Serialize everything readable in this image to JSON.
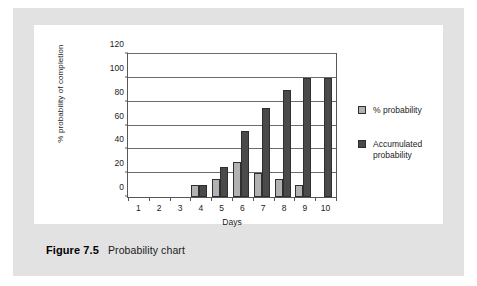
{
  "figure": {
    "caption_number": "Figure 7.5",
    "caption_text": "Probability chart"
  },
  "legend": {
    "position": "right",
    "items": [
      {
        "label": "% probability",
        "color": "#b2b2b2"
      },
      {
        "label": "Accumulated probability",
        "color": "#4a4a4a"
      }
    ]
  },
  "chart_data": {
    "type": "bar",
    "title": "",
    "subtitle": "",
    "xlabel": "Days",
    "ylabel": "% probability of completion",
    "categories": [
      "1",
      "2",
      "3",
      "4",
      "5",
      "6",
      "7",
      "8",
      "9",
      "10"
    ],
    "series": [
      {
        "name": "% probability",
        "color": "#b2b2b2",
        "values": [
          0,
          0,
          0,
          10,
          15,
          29,
          20,
          15,
          10,
          0
        ]
      },
      {
        "name": "Accumulated probability",
        "color": "#4a4a4a",
        "values": [
          0,
          0,
          0,
          10,
          25,
          55,
          75,
          90,
          100,
          100
        ]
      }
    ],
    "ylim": [
      0,
      120
    ],
    "yticks": [
      0,
      20,
      40,
      60,
      80,
      100,
      120
    ],
    "ytick_labels": [
      "0",
      "20",
      "40",
      "60",
      "80",
      "100",
      "120"
    ],
    "grid": true,
    "grid_axis": "y",
    "legend_position": "right"
  }
}
